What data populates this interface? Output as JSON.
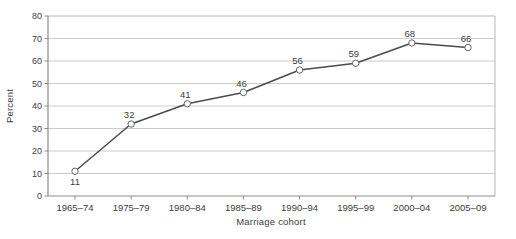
{
  "chart_data": {
    "type": "line",
    "categories": [
      "1965–74",
      "1975–79",
      "1980–84",
      "1985–89",
      "1990–94",
      "1995–99",
      "2000–04",
      "2005–09"
    ],
    "values": [
      11,
      32,
      41,
      46,
      56,
      59,
      68,
      66
    ],
    "data_labels": [
      "11",
      "32",
      "41",
      "46",
      "56",
      "59",
      "68",
      "66"
    ],
    "title": "",
    "xlabel": "Marriage cohort",
    "ylabel": "Percent",
    "ylim": [
      0,
      80
    ],
    "ytick_step": 10,
    "yticks": [
      0,
      10,
      20,
      30,
      40,
      50,
      60,
      70,
      80
    ],
    "grid": "horizontal",
    "legend": "none",
    "marker": "open-circle",
    "first_label_position": "below",
    "colors": {
      "line": "#4a4a4a",
      "marker_fill": "#ffffff",
      "marker_stroke": "#666666",
      "grid": "#cccccc",
      "axis": "#8c8c8c",
      "frame": "#b8b8b8",
      "text": "#3d3d3d"
    }
  }
}
